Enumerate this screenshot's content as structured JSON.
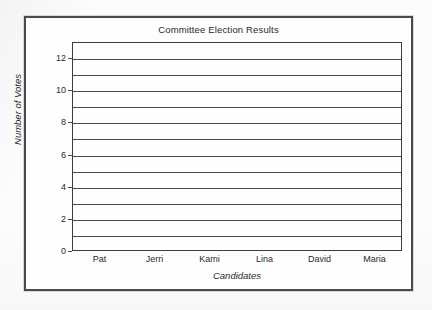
{
  "chart_data": {
    "type": "bar",
    "title": "Committee Election Results",
    "xlabel": "Candidates",
    "ylabel": "Number of Votes",
    "categories": [
      "Pat",
      "Jerri",
      "Kami",
      "Lina",
      "David",
      "Maria"
    ],
    "values": [
      0,
      0,
      0,
      0,
      0,
      0
    ],
    "ylim": [
      0,
      13
    ],
    "ytick_labels": [
      "0",
      "2",
      "4",
      "6",
      "8",
      "10",
      "12"
    ],
    "ytick_values": [
      0,
      2,
      4,
      6,
      8,
      10,
      12
    ],
    "gridline_values": [
      1,
      2,
      3,
      4,
      5,
      6,
      7,
      8,
      9,
      10,
      11,
      12
    ],
    "grid": true,
    "legend": "none",
    "note": "Blank bar-graph template: no bars drawn, all candidate values are zero",
    "colors": {
      "frame": "#4a4a4a",
      "axis": "#3d3d3d",
      "gridline": "#494949",
      "text": "#2b2b2b",
      "background": "#fdfdfd"
    }
  }
}
